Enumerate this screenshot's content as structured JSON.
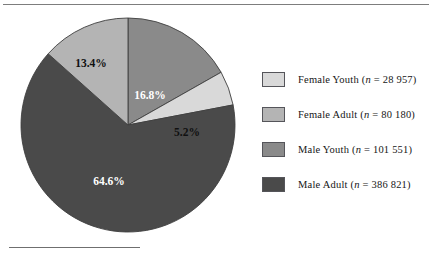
{
  "figure": {
    "top_rule": "top-rule",
    "footnote_rule": "footnote-rule"
  },
  "chart_data": {
    "type": "pie",
    "title": "",
    "subtitle": "",
    "xlabel": "",
    "ylabel": "",
    "legend_position": "right",
    "grid": false,
    "start_angle_deg": 0,
    "direction": "clockwise",
    "categories": [
      "Male Youth",
      "Female Youth",
      "Male Adult",
      "Female Adult"
    ],
    "values": [
      16.8,
      5.2,
      64.6,
      13.4
    ],
    "counts": [
      101551,
      28957,
      386821,
      80180
    ],
    "slices": [
      {
        "name": "Male Youth",
        "percent": 16.8,
        "percent_label": "16.8%",
        "count": 101551,
        "count_label": "101 551",
        "color": "#8a8a8a",
        "label_color": "#ffffff",
        "label_x": 131,
        "label_y": 80
      },
      {
        "name": "Female Youth",
        "percent": 5.2,
        "percent_label": "5.2%",
        "count": 28957,
        "count_label": "28 957",
        "color": "#d9d9d9",
        "label_color": "#101010",
        "label_x": 168,
        "label_y": 117
      },
      {
        "name": "Male Adult",
        "percent": 64.6,
        "percent_label": "64.6%",
        "count": 386821,
        "count_label": "386 821",
        "color": "#4a4a4a",
        "label_color": "#ffffff",
        "label_x": 90,
        "label_y": 166
      },
      {
        "name": "Female Adult",
        "percent": 13.4,
        "percent_label": "13.4%",
        "count": 80180,
        "count_label": "80 180",
        "color": "#b4b4b4",
        "label_color": "#101010",
        "label_x": 72,
        "label_y": 48
      }
    ]
  },
  "legend": {
    "items": [
      {
        "key": "female-youth",
        "name": "Female Youth",
        "prefix": "Female Youth (",
        "n_symbol": "n",
        "equals": " = ",
        "count_label": "28 957",
        "suffix": ")",
        "full_label": "Female Youth (n = 28 957)",
        "color": "#d9d9d9"
      },
      {
        "key": "female-adult",
        "name": "Female Adult",
        "prefix": "Female Adult (",
        "n_symbol": "n",
        "equals": " = ",
        "count_label": "80 180",
        "suffix": ")",
        "full_label": "Female Adult (n = 80 180)",
        "color": "#b4b4b4"
      },
      {
        "key": "male-youth",
        "name": "Male Youth",
        "prefix": "Male Youth (",
        "n_symbol": "n",
        "equals": " = ",
        "count_label": "101 551",
        "suffix": ")",
        "full_label": "Male Youth (n = 101 551)",
        "color": "#8a8a8a"
      },
      {
        "key": "male-adult",
        "name": "Male Adult",
        "prefix": "Male Adult (",
        "n_symbol": "n",
        "equals": " = ",
        "count_label": "386 821",
        "suffix": ")",
        "full_label": "Male Adult (n = 386 821)",
        "color": "#4a4a4a"
      }
    ]
  }
}
